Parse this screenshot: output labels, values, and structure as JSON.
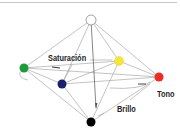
{
  "diagram": {
    "title": "",
    "labels": {
      "saturation": "Saturación",
      "hue": "Tono",
      "brightness": "Brillo"
    },
    "nodes": [
      {
        "id": "white",
        "name": "white-node",
        "color": "#ffffff",
        "stroke": "#888888",
        "x": 91,
        "y": 20
      },
      {
        "id": "green",
        "name": "green-node",
        "color": "#1e9a3c",
        "x": 24,
        "y": 68
      },
      {
        "id": "navy",
        "name": "navy-node",
        "color": "#1a1f6e",
        "x": 62,
        "y": 84
      },
      {
        "id": "yellow",
        "name": "yellow-node",
        "color": "#f5e63a",
        "x": 119,
        "y": 61
      },
      {
        "id": "red",
        "name": "red-node",
        "color": "#ee2b24",
        "x": 159,
        "y": 77
      },
      {
        "id": "black",
        "name": "black-node",
        "color": "#000000",
        "x": 91,
        "y": 122
      }
    ],
    "colors": {
      "line": "#999999",
      "border": "#c8c8c8",
      "text": "#222222"
    }
  }
}
